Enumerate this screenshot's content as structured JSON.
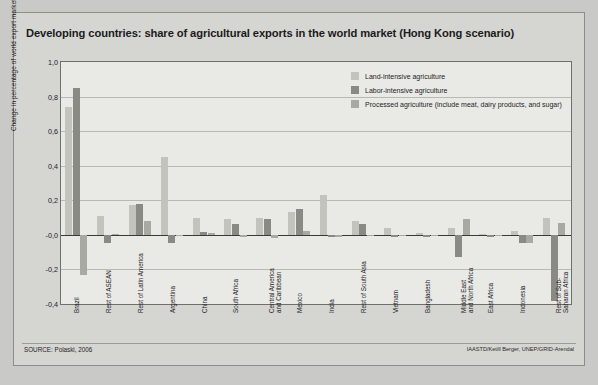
{
  "figure": {
    "title": "Developing countries: share of agricultural exports in the world market (Hong Kong scenario)",
    "source": "SOURCE: Polaski, 2006",
    "credit": "IAASTD/Ketill Berger, UNEP/GRID-Arendal"
  },
  "colors": {
    "land_intensive": "#c3c3be",
    "labor_intensive": "#8a8a85",
    "processed": "#a9a9a4",
    "panel": "#e9e9e6",
    "page": "#d5d5d2",
    "grid": "#b9b9b4",
    "axis": "#3a3a38"
  },
  "chart_data": {
    "type": "bar",
    "title": "Developing countries: share of agricultural exports in the world market (Hong Kong scenario)",
    "xlabel": "",
    "ylabel": "Change in percentage of world export market",
    "ylim": [
      -0.4,
      1.0
    ],
    "yticks": [
      1.0,
      0.8,
      0.6,
      0.4,
      0.2,
      -0.0,
      -0.2,
      -0.4
    ],
    "ytick_labels": [
      "1,0",
      "0,8",
      "0,6",
      "0,4",
      "0,2",
      "-0,0",
      "-0,2",
      "-0,4"
    ],
    "grid": true,
    "legend_position": "top-right",
    "categories": [
      "Brazil",
      "Rest of ASEAN",
      "Rest of Latin America",
      "Argentina",
      "China",
      "South Africa",
      "Central America\nand Caribbean",
      "Mexico",
      "India",
      "Rest of South Asia",
      "Vietnam",
      "Bangladesh",
      "Middle East\nand North Africa",
      "East Africa",
      "Indonesia",
      "Rest of Sub-\nSaharan Africa"
    ],
    "series": [
      {
        "name": "Land-intensive agriculture",
        "values": [
          0.74,
          0.11,
          0.17,
          0.45,
          0.1,
          0.09,
          0.1,
          0.13,
          0.23,
          0.08,
          0.04,
          0.01,
          0.04,
          0.005,
          0.02,
          0.1
        ]
      },
      {
        "name": "Labor-intensive agriculture",
        "values": [
          0.85,
          -0.05,
          0.18,
          -0.05,
          0.015,
          0.06,
          0.09,
          0.15,
          -0.01,
          0.06,
          -0.015,
          -0.01,
          -0.13,
          -0.01,
          -0.05,
          -0.38
        ]
      },
      {
        "name": "Processed agriculture (include meat, dairy products, and sugar)",
        "values": [
          -0.23,
          0.005,
          0.08,
          0.0,
          0.01,
          -0.01,
          -0.02,
          0.02,
          -0.01,
          0.0,
          0.0,
          -0.005,
          0.09,
          0.0,
          -0.05,
          0.07
        ]
      }
    ]
  },
  "legend": {
    "items": [
      {
        "label": "Land-intensive agriculture",
        "color": "#c3c3be"
      },
      {
        "label": "Labor-intensive agriculture",
        "color": "#8a8a85"
      },
      {
        "label": "Processed agriculture (include meat, dairy products, and sugar)",
        "color": "#a9a9a4"
      }
    ]
  }
}
